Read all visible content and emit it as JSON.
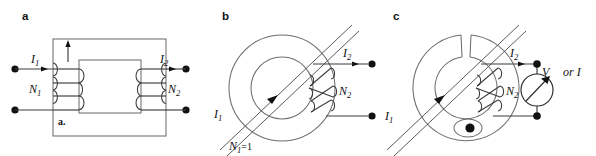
{
  "figure": {
    "background_color": "#ffffff",
    "ink_color": "#333333",
    "width": 596,
    "height": 156
  },
  "panels": [
    {
      "id": "a",
      "letter": "a",
      "caption": "Conventional two-winding transformer with closed rectangular magnetic core",
      "inner_label": "a.",
      "labels": {
        "primary_current": "I",
        "primary_current_sub": "1",
        "secondary_current": "I",
        "secondary_current_sub": "2",
        "primary_turns": "N",
        "primary_turns_sub": "1",
        "secondary_turns": "N",
        "secondary_turns_sub": "2"
      },
      "flux_arrow_direction": "up",
      "primary_coil_turns": 3,
      "secondary_coil_turns": 3,
      "terminal_count": 4
    },
    {
      "id": "b",
      "letter": "b",
      "caption": "Toroidal current transformer, single-turn primary conductor threaded through core",
      "labels": {
        "primary_current": "I",
        "primary_current_sub": "1",
        "secondary_current": "I",
        "secondary_current_sub": "2",
        "secondary_turns": "N",
        "secondary_turns_sub": "2",
        "primary_turns_equation": "N",
        "primary_turns_equation_sub": "1",
        "primary_turns_equation_value": "=1"
      },
      "secondary_coil_turns": 3,
      "terminal_count": 2,
      "core_shape": "toroid"
    },
    {
      "id": "c",
      "letter": "c",
      "caption": "Split-core clamp-on current transformer with hinge, gap and output meter",
      "labels": {
        "primary_current": "I",
        "primary_current_sub": "1",
        "secondary_current": "I",
        "secondary_current_sub": "2",
        "secondary_turns": "N",
        "secondary_turns_sub": "2",
        "meter_symbol": "V",
        "meter_alternative": "or I"
      },
      "secondary_coil_turns": 3,
      "terminal_count": 2,
      "core_shape": "split-toroid",
      "has_hinge": true,
      "has_gap": true,
      "meter_type": "voltmeter-or-ammeter"
    }
  ]
}
